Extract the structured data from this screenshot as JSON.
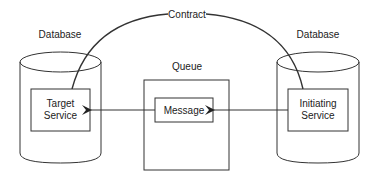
{
  "diagram": {
    "contract_label": "Contract",
    "left_db": {
      "label": "Database",
      "service_line1": "Target",
      "service_line2": "Service"
    },
    "right_db": {
      "label": "Database",
      "service_line1": "Initiating",
      "service_line2": "Service"
    },
    "queue": {
      "label": "Queue",
      "message_label": "Message"
    },
    "colors": {
      "line": "#333333",
      "text": "#222222",
      "background": "#ffffff"
    }
  }
}
